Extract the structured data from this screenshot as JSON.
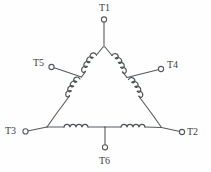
{
  "diagram": {
    "type": "electrical-schematic",
    "line_color": "#55595d",
    "background_color": "#fefefe",
    "terminals": [
      {
        "id": "T1",
        "label": "T1",
        "position": "top",
        "label_x": 99,
        "label_y": 3,
        "node_x": 104,
        "node_y": 18
      },
      {
        "id": "T5",
        "label": "T5",
        "position": "upper-left",
        "label_x": 33,
        "label_y": 58,
        "node_x": 55,
        "node_y": 68
      },
      {
        "id": "T4",
        "label": "T4",
        "position": "upper-right",
        "label_x": 168,
        "label_y": 61,
        "node_x": 161,
        "node_y": 70
      },
      {
        "id": "T3",
        "label": "T3",
        "position": "lower-left",
        "label_x": 4,
        "label_y": 128,
        "node_x": 25,
        "node_y": 131
      },
      {
        "id": "T2",
        "label": "T2",
        "position": "lower-right",
        "label_x": 188,
        "label_y": 130,
        "node_x": 182,
        "node_y": 132
      },
      {
        "id": "T6",
        "label": "T6",
        "position": "bottom",
        "label_x": 99,
        "label_y": 158,
        "node_x": 105,
        "node_y": 148
      }
    ],
    "windings": [
      {
        "name": "left-upper-coil",
        "from": "T1-apex",
        "to": "T5-junction",
        "bumps": 4
      },
      {
        "name": "left-lower-coil",
        "from": "T5-junction",
        "to": "T3-corner",
        "bumps": 4
      },
      {
        "name": "right-upper-coil",
        "from": "T1-apex",
        "to": "T4-junction",
        "bumps": 4
      },
      {
        "name": "right-lower-coil",
        "from": "T4-junction",
        "to": "T2-corner",
        "bumps": 4
      },
      {
        "name": "bottom-left-coil",
        "from": "T3-corner",
        "to": "T6-tap",
        "bumps": 4
      },
      {
        "name": "bottom-right-coil",
        "from": "T6-tap",
        "to": "T2-corner",
        "bumps": 4
      }
    ]
  }
}
